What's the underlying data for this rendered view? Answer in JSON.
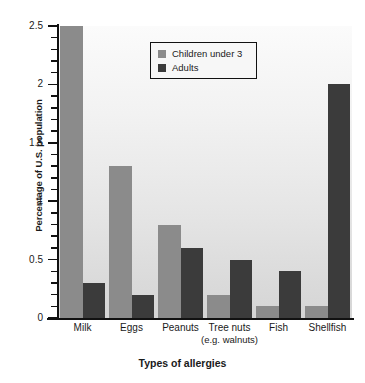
{
  "chart_data": {
    "type": "bar",
    "title": "",
    "xlabel": "Types of allergies",
    "ylabel": "Percentage of U.S. population",
    "categories": [
      "Milk",
      "Eggs",
      "Peanuts",
      "Tree nuts (e.g. walnuts)",
      "Fish",
      "Shellfish"
    ],
    "category_labels": [
      {
        "main": "Milk",
        "sub": ""
      },
      {
        "main": "Eggs",
        "sub": ""
      },
      {
        "main": "Peanuts",
        "sub": ""
      },
      {
        "main": "Tree nuts",
        "sub": "(e.g. walnuts)"
      },
      {
        "main": "Fish",
        "sub": ""
      },
      {
        "main": "Shellfish",
        "sub": ""
      }
    ],
    "series": [
      {
        "name": "Children under 3",
        "color": "#8b8b8b",
        "values": [
          2.5,
          1.3,
          0.8,
          0.2,
          0.1,
          0.1
        ]
      },
      {
        "name": "Adults",
        "color": "#3b3b3b",
        "values": [
          0.3,
          0.2,
          0.6,
          0.5,
          0.4,
          2.0
        ]
      }
    ],
    "ylim": [
      0,
      2.5
    ],
    "ytick_labels": [
      "0",
      "0.5",
      "1",
      "1.5",
      "2",
      "2.5"
    ],
    "ytick_values": [
      0,
      0.5,
      1,
      1.5,
      2,
      2.5
    ],
    "yminor_step": 0.1,
    "grid": false,
    "legend_position": "top-center"
  },
  "legend": {
    "entries": [
      {
        "label": "Children under 3",
        "swatch": "light"
      },
      {
        "label": "Adults",
        "swatch": "dark"
      }
    ]
  },
  "axis": {
    "y_title": "Percentage of U.S. population",
    "x_title": "Types of allergies",
    "y_labels": [
      "2.5",
      "2",
      "1.5",
      "1",
      "0.5",
      "0"
    ]
  },
  "colors": {
    "series_light": "#8b8b8b",
    "series_dark": "#3b3b3b",
    "axis": "#111111",
    "plot_background_top": "#fbfbfb",
    "plot_background_bottom": "#d5d5d5",
    "page_background": "#ffffff"
  }
}
